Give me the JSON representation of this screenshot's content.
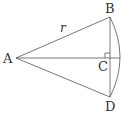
{
  "figure": {
    "type": "geometry-sector",
    "points": {
      "A": {
        "label": "A",
        "x": 16,
        "y": 58
      },
      "B": {
        "label": "B",
        "x": 110,
        "y": 17
      },
      "C": {
        "label": "C",
        "x": 110,
        "y": 58
      },
      "D": {
        "label": "D",
        "x": 110,
        "y": 97
      }
    },
    "radius_label": "r",
    "right_angle_at": "C",
    "colors": {
      "line": "#555555",
      "text": "#333333",
      "background": "#ffffff"
    }
  }
}
